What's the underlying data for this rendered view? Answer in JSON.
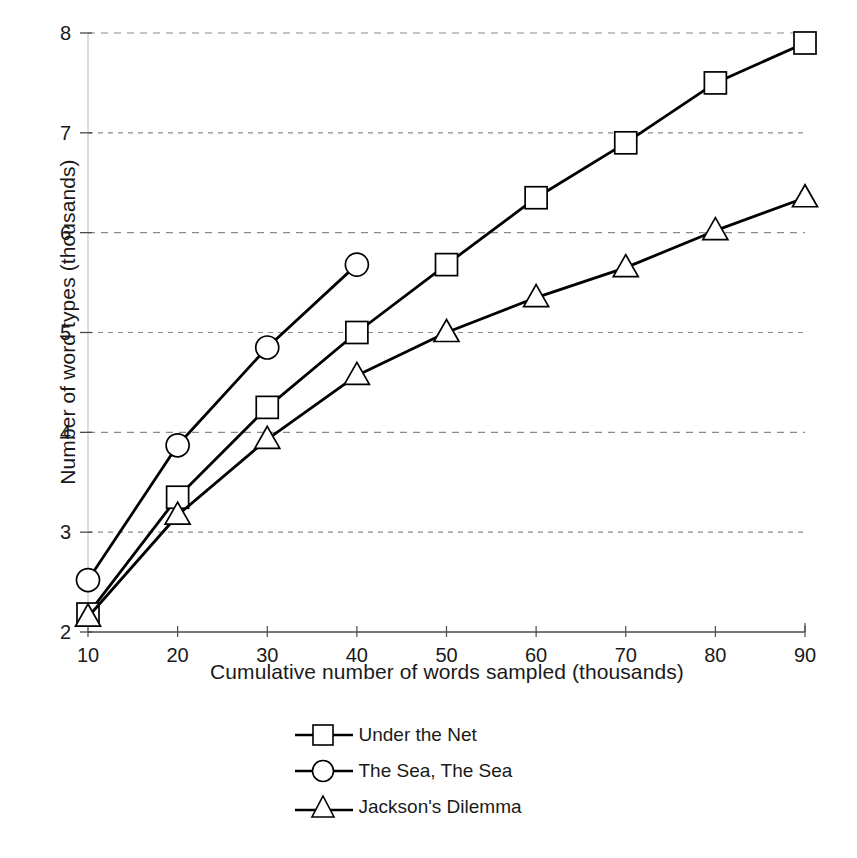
{
  "chart_data": {
    "type": "line",
    "title": "",
    "xlabel": "Cumulative  number of words sampled (thousands)",
    "ylabel": "Number of word types (thousands)",
    "x": [
      10,
      20,
      30,
      40,
      50,
      60,
      70,
      80,
      90
    ],
    "xlim": [
      10,
      90
    ],
    "ylim": [
      2,
      8
    ],
    "xticks": [
      "10",
      "20",
      "30",
      "40",
      "50",
      "60",
      "70",
      "80",
      "90"
    ],
    "yticks": [
      "2",
      "3",
      "4",
      "5",
      "6",
      "7",
      "8"
    ],
    "grid": "horizontal-dashed",
    "legend_position": "below-center",
    "series": [
      {
        "name": "Under the Net",
        "marker": "square",
        "x": [
          10,
          20,
          30,
          40,
          50,
          60,
          70,
          80,
          90
        ],
        "values": [
          2.18,
          3.35,
          4.25,
          5.0,
          5.68,
          6.35,
          6.9,
          7.5,
          7.9
        ]
      },
      {
        "name": "The Sea, The Sea",
        "marker": "circle",
        "x": [
          10,
          20,
          30,
          40
        ],
        "values": [
          2.52,
          3.87,
          4.85,
          5.68
        ]
      },
      {
        "name": "Jackson's Dilemma",
        "marker": "triangle",
        "x": [
          10,
          20,
          30,
          40,
          50,
          60,
          70,
          80,
          90
        ],
        "values": [
          2.15,
          3.17,
          3.93,
          4.57,
          5.0,
          5.35,
          5.65,
          6.02,
          6.35
        ]
      }
    ],
    "colors": {
      "line": "#000000",
      "marker_fill": "#ffffff",
      "marker_stroke": "#000000",
      "grid": "#8a8a8a",
      "axis": "#555555",
      "text": "#1a1a1a",
      "background": "#ffffff"
    }
  },
  "legend": {
    "items": [
      {
        "label": "Under the Net",
        "marker": "square"
      },
      {
        "label": "The Sea, The Sea",
        "marker": "circle"
      },
      {
        "label": "Jackson's Dilemma",
        "marker": "triangle"
      }
    ]
  }
}
